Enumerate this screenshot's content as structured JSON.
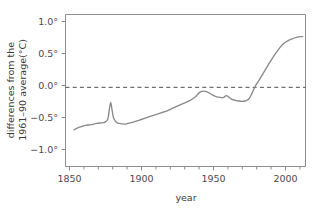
{
  "chart_data": {
    "type": "line",
    "title": "",
    "xlabel": "year",
    "ylabel": "differences from the 1961–90 average(°C)",
    "ylabel_line1": "differences from the",
    "ylabel_line2": "1961–90 average(°C)",
    "xlim": [
      1846,
      2016
    ],
    "ylim": [
      -1.25,
      1.15
    ],
    "grid": false,
    "legend": null,
    "x_ticks": [
      1850,
      1900,
      1950,
      2000
    ],
    "x_tick_labels": [
      "1850",
      "1900",
      "1950",
      "2000"
    ],
    "x_minor_tick_step": 10,
    "y_ticks": [
      1.0,
      0.5,
      0.0,
      -0.5,
      -1.0
    ],
    "y_tick_labels": [
      "1.0°",
      "0.5°",
      "0.0°",
      "−0.5°",
      "−1.0°"
    ],
    "reference_lines": [
      {
        "name": "zero-baseline",
        "axis": "y",
        "value": 0.0,
        "style": "dashed"
      }
    ],
    "series": [
      {
        "name": "global temperature anomaly",
        "color": "#8a8a8a",
        "x": [
          1852,
          1856,
          1860,
          1864,
          1868,
          1872,
          1874,
          1876,
          1877,
          1878,
          1879,
          1880,
          1882,
          1884,
          1888,
          1890,
          1894,
          1898,
          1902,
          1906,
          1910,
          1914,
          1918,
          1922,
          1926,
          1930,
          1934,
          1938,
          1941,
          1944,
          1947,
          1950,
          1953,
          1956,
          1958,
          1960,
          1962,
          1964,
          1967,
          1970,
          1972,
          1974,
          1976,
          1978,
          1980,
          1983,
          1986,
          1989,
          1992,
          1995,
          1998,
          2001,
          2004,
          2007,
          2010,
          2012,
          2014
        ],
        "y": [
          -0.67,
          -0.63,
          -0.6,
          -0.59,
          -0.57,
          -0.56,
          -0.55,
          -0.5,
          -0.36,
          -0.24,
          -0.36,
          -0.48,
          -0.55,
          -0.57,
          -0.58,
          -0.57,
          -0.55,
          -0.52,
          -0.49,
          -0.46,
          -0.43,
          -0.4,
          -0.37,
          -0.33,
          -0.29,
          -0.25,
          -0.21,
          -0.15,
          -0.08,
          -0.06,
          -0.08,
          -0.12,
          -0.15,
          -0.16,
          -0.16,
          -0.13,
          -0.16,
          -0.19,
          -0.21,
          -0.22,
          -0.22,
          -0.21,
          -0.18,
          -0.1,
          0.0,
          0.11,
          0.22,
          0.33,
          0.44,
          0.54,
          0.63,
          0.7,
          0.74,
          0.77,
          0.79,
          0.8,
          0.8
        ]
      }
    ]
  },
  "colors": {
    "series": "#8a8a8a",
    "axis": "#8c8c8c",
    "zero_line": "#4f4f4f",
    "text": "#3a3a3a",
    "background": "#ffffff"
  }
}
